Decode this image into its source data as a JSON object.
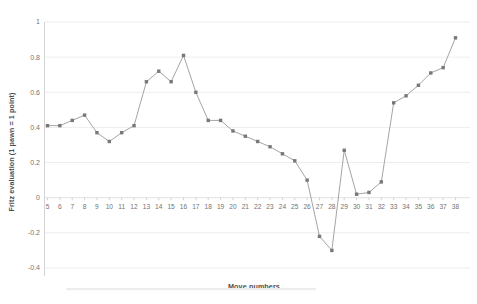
{
  "chart_data": {
    "type": "line",
    "title": "",
    "xlabel": "Move numbers",
    "ylabel": "Fritz evaluation (1 pawn = 1 point)",
    "categories": [
      "5",
      "6",
      "7",
      "8",
      "9",
      "10",
      "11",
      "12",
      "13",
      "14",
      "15",
      "16",
      "17",
      "18",
      "19",
      "20",
      "21",
      "22",
      "23",
      "24",
      "25",
      "26",
      "27",
      "28",
      "29",
      "30",
      "31",
      "32",
      "33",
      "34",
      "35",
      "36",
      "37",
      "38"
    ],
    "values": [
      0.41,
      0.41,
      0.44,
      0.47,
      0.37,
      0.32,
      0.37,
      0.41,
      0.66,
      0.72,
      0.66,
      0.81,
      0.6,
      0.44,
      0.44,
      0.38,
      0.35,
      0.32,
      0.29,
      0.25,
      0.21,
      0.1,
      -0.22,
      -0.3,
      0.27,
      0.02,
      0.03,
      0.09,
      0.54,
      0.58,
      0.64,
      0.71,
      0.74,
      0.91
    ],
    "ylim": [
      -0.4,
      1.0
    ],
    "yticks": [
      "1",
      "0.8",
      "0.6",
      "0.4",
      "0.2",
      "0",
      "-0.2",
      "-0.4"
    ],
    "ytick_values": [
      1,
      0.8,
      0.6,
      0.4,
      0.2,
      0,
      -0.2,
      -0.4
    ],
    "grid": true,
    "legend": "none",
    "series_name": "Fritz evaluation",
    "colors": {
      "marker": "#787878",
      "line": "#9a9a9a",
      "gridline": "#e8e8e8",
      "axis": "#c9c9c9",
      "tick_text": "#737373",
      "title_text": "#4d4d4d",
      "background": "#ffffff"
    }
  }
}
